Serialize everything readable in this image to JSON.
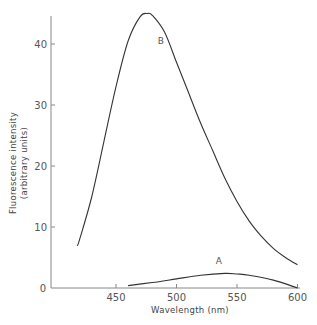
{
  "chart_data": {
    "type": "line",
    "title": "",
    "xlabel": "Wavelength (nm)",
    "ylabel": "Fluorescence intensity (arbitrary units)",
    "ylabel_line1": "Fluorescence intensity",
    "ylabel_line2": "(arbitrary units)",
    "xlim": [
      400,
      600
    ],
    "ylim": [
      0,
      46
    ],
    "x_ticks": [
      450,
      500,
      550,
      600
    ],
    "y_ticks": [
      0,
      10,
      20,
      30,
      40
    ],
    "grid": false,
    "legend": "none (inline curve labels)",
    "series": [
      {
        "name": "B",
        "label_position": {
          "x": 487,
          "y": 40
        },
        "x": [
          418,
          420,
          430,
          440,
          450,
          460,
          470,
          476,
          480,
          490,
          500,
          510,
          520,
          530,
          540,
          550,
          560,
          570,
          580,
          590,
          600
        ],
        "values": [
          6.9,
          8,
          15,
          24,
          33,
          40.5,
          44.5,
          45,
          44.7,
          42,
          37,
          32,
          27,
          22.5,
          18,
          14.2,
          11,
          8.5,
          6.5,
          5,
          3.8
        ]
      },
      {
        "name": "A",
        "label_position": {
          "x": 535,
          "y": 4
        },
        "x": [
          460,
          480,
          500,
          520,
          540,
          550,
          560,
          580,
          600
        ],
        "values": [
          0.4,
          0.9,
          1.5,
          2.1,
          2.4,
          2.3,
          2.1,
          1.3,
          0
        ]
      }
    ]
  }
}
